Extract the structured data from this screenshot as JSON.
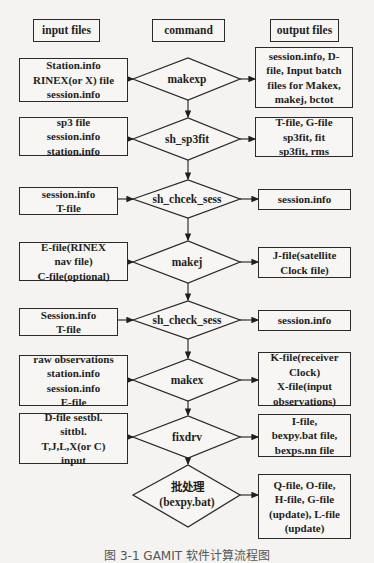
{
  "headers": {
    "input": "input files",
    "command": "command",
    "output": "output files"
  },
  "steps": [
    {
      "input": "Station.info\nRINEX(or X) file\nsession.info",
      "command": "makexp",
      "output": "session.info, D-\nfile, Input batch\nfiles for Makex,\nmakej, bctot"
    },
    {
      "input": "sp3 file\nsession.info\nstation.info",
      "command": "sh_sp3fit",
      "output": "T-file, G-file\nsp3fit, fit\nsp3fit, rms"
    },
    {
      "input": "session.info\nT-file",
      "command": "sh_chcek_sess",
      "output": "session.info"
    },
    {
      "input": "E-file(RINEX\nnav file)\nC-file(optional)",
      "command": "makej",
      "output": "J-file(satellite\nClock file)"
    },
    {
      "input": "Session.info\nT-file",
      "command": "sh_check_sess",
      "output": "session.info"
    },
    {
      "input": "raw observations\nstation.info\nsession.info\nE-file",
      "command": "makex",
      "output": "K-file(receiver\nClock)\nX-file(input\nobservations)"
    },
    {
      "input": "D-file sestbl.\nsittbl.\nT,J,L,X(or C)\ninput",
      "command": "fixdrv",
      "output": "I-file,\nbexpy.bat file,\nbexps.nn file"
    },
    {
      "input": "",
      "command": "批处理\n(bexpy.bat)",
      "output": "Q-file, O-file,\nH-file, G-file\n(update), L-file\n(update)"
    }
  ],
  "caption": "图 3-1  GAMIT 软件计算流程图"
}
